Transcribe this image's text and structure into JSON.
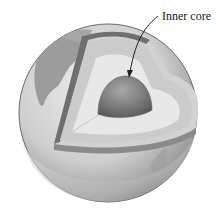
{
  "diagram": {
    "labels": [
      {
        "id": "inner-core",
        "text": "Inner core"
      }
    ],
    "colors": {
      "background": "#ffffff",
      "ocean": "#d6d6d6",
      "land": "#9a9a9a",
      "crust_edge": "#6f6f6f",
      "mantle": "#cfcfcf",
      "outer_core": "#e6e6e6",
      "inner_core": "#7c7c7c",
      "label_text": "#222222"
    }
  }
}
